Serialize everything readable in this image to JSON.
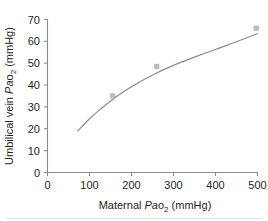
{
  "chart_data": {
    "type": "scatter",
    "title": "",
    "subtitle": "",
    "xlabel_parts": {
      "pre": "Maternal ",
      "italic": "Pa",
      "roman": "o",
      "sub": "2",
      "post": " (mmHg)"
    },
    "ylabel_parts": {
      "pre": "Umbilical vein ",
      "italic": "Pa",
      "roman": "o",
      "sub": "2",
      "post": " (mmHg)"
    },
    "xlabel": "Maternal Pao2 (mmHg)",
    "ylabel": "Umbilical vein Pao2 (mmHg)",
    "xlim": [
      0,
      520
    ],
    "ylim": [
      0,
      72
    ],
    "xticks": [
      0,
      100,
      200,
      300,
      400,
      500
    ],
    "xtick_labels": [
      "0",
      "100",
      "200",
      "300",
      "400",
      "500"
    ],
    "yticks": [
      0,
      10,
      20,
      30,
      40,
      50,
      60,
      70
    ],
    "ytick_labels": [
      "0",
      "10",
      "20",
      "30",
      "40",
      "50",
      "60",
      "70"
    ],
    "grid": false,
    "legend": false,
    "legend_position": "none",
    "marker_color": "#bdbdbd",
    "curve_color": "#8a8a8a",
    "axis_color": "#8c8c8c",
    "text_color": "#231f20",
    "background_color": "#ffffff",
    "series": [
      {
        "name": "Observed data",
        "type": "scatter",
        "marker": "square",
        "x": [
          155,
          260,
          497
        ],
        "y": [
          35,
          48.5,
          66
        ],
        "points": [
          {
            "x": 155,
            "y": 35
          },
          {
            "x": 260,
            "y": 48.5
          },
          {
            "x": 497,
            "y": 66
          }
        ]
      },
      {
        "name": "Fitted curve",
        "type": "line",
        "x": [
          72,
          100,
          130,
          155,
          180,
          210,
          240,
          260,
          290,
          320,
          350,
          380,
          410,
          440,
          470,
          500
        ],
        "y": [
          19.0,
          24.6,
          29.6,
          33.4,
          36.8,
          40.4,
          43.6,
          45.5,
          48.2,
          50.6,
          52.8,
          54.9,
          57.0,
          59.1,
          61.3,
          63.6
        ]
      }
    ]
  }
}
